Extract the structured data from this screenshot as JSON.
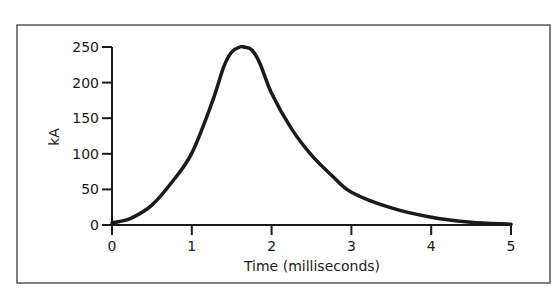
{
  "chart_data": {
    "type": "line",
    "title": "",
    "xlabel": "Time (milliseconds)",
    "ylabel": "kA",
    "xlim": [
      0,
      5
    ],
    "ylim": [
      0,
      250
    ],
    "grid": false,
    "legend": null,
    "x_ticks": [
      0,
      1,
      2,
      3,
      4,
      5
    ],
    "y_ticks": [
      0,
      50,
      100,
      150,
      200,
      250
    ],
    "series": [
      {
        "name": "Current",
        "x": [
          0,
          0.1,
          0.25,
          0.5,
          0.75,
          1.0,
          1.25,
          1.4,
          1.5,
          1.6,
          1.65,
          1.75,
          1.85,
          2.0,
          2.25,
          2.5,
          2.75,
          3.0,
          3.5,
          4.0,
          4.5,
          5.0
        ],
        "values": [
          3,
          5,
          10,
          28,
          60,
          101,
          171,
          222,
          243,
          250,
          250,
          246,
          228,
          185,
          135,
          98,
          70,
          46,
          24,
          11,
          4,
          1
        ]
      }
    ]
  },
  "colors": {
    "line": "#1a1a1a",
    "frame": "#555555",
    "background": "#ffffff"
  }
}
